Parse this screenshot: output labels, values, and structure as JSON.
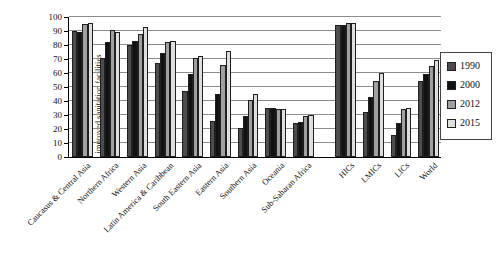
{
  "chart_data": {
    "type": "bar",
    "title": "",
    "xlabel": "",
    "ylabel": "% of population with access to improved sanitation facilities",
    "ylabel_line1": "% of population with access to",
    "ylabel_line2": "improved sanitation facilities",
    "ylim": [
      0,
      100
    ],
    "ytick_step": 10,
    "grid": true,
    "legend_position": "right",
    "categories": [
      "Caucasus & Central Asia",
      "Northern Africa",
      "Western Asia",
      "Latin America & Caribbean",
      "South Eastern Asia",
      "Eastern Asia",
      "Southern Asia",
      "Oceania",
      "Sub-Saharan Africa",
      "HICs",
      "LMICs",
      "LICs",
      "World"
    ],
    "aggregate_groups_start_index": 9,
    "series": [
      {
        "name": "1990",
        "color": "#4d4d4d",
        "values": [
          90,
          71,
          80,
          67,
          47,
          26,
          21,
          35,
          24,
          94,
          32,
          16,
          54
        ]
      },
      {
        "name": "2000",
        "color": "#121212",
        "values": [
          89,
          82,
          83,
          74,
          59,
          45,
          29,
          35,
          25,
          94,
          43,
          24,
          59
        ]
      },
      {
        "name": "2012",
        "color": "#a0a0a0",
        "values": [
          95,
          91,
          88,
          82,
          71,
          66,
          41,
          34,
          29,
          96,
          54,
          34,
          65
        ]
      },
      {
        "name": "2015",
        "color": "#dedede",
        "values": [
          96,
          89,
          93,
          83,
          72,
          76,
          45,
          34,
          30,
          96,
          60,
          35,
          69
        ]
      }
    ]
  }
}
